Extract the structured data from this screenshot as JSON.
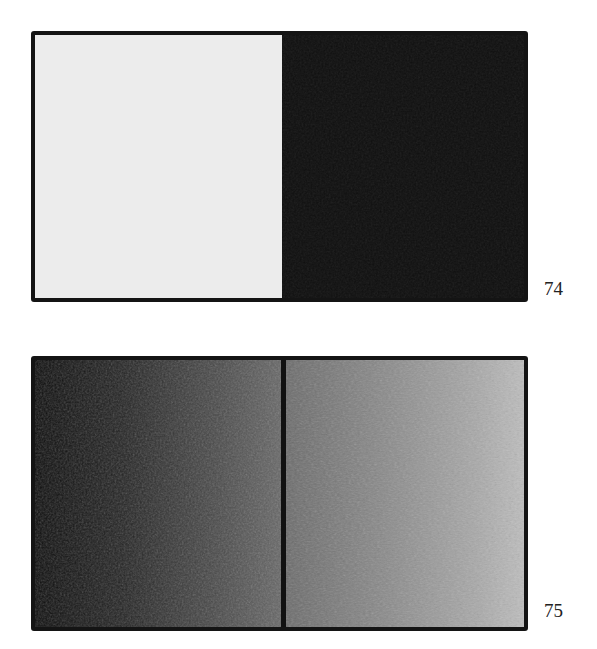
{
  "figures": [
    {
      "number": "74",
      "panels": [
        {
          "name": "light-panel",
          "tone": "#ebebeb"
        },
        {
          "name": "dark-panel",
          "tone": "#1a1a1a"
        }
      ]
    },
    {
      "number": "75",
      "panels": [
        {
          "name": "dark-gradient-panel",
          "tone_start": "#0d0d0d",
          "tone_end": "#6a6a6a"
        },
        {
          "name": "mid-gradient-panel",
          "tone_start": "#6e6e6e",
          "tone_end": "#b8b8b8"
        }
      ]
    }
  ]
}
